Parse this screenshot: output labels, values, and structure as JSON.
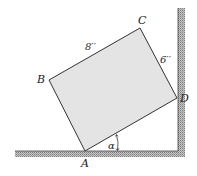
{
  "diagram": {
    "points": {
      "A": {
        "label": "A",
        "x": 85,
        "y": 151
      },
      "B": {
        "label": "B",
        "x": 49,
        "y": 80
      },
      "C": {
        "label": "C",
        "x": 140,
        "y": 28
      },
      "D": {
        "label": "D",
        "x": 177,
        "y": 98
      }
    },
    "dimensions": {
      "BC": "8′′",
      "CD": "6′′"
    },
    "angle_label": "α",
    "colors": {
      "block_fill": "#e4e4e4",
      "outline": "#333333",
      "hatch": "#8a8a8a",
      "background": "#ffffff"
    }
  }
}
